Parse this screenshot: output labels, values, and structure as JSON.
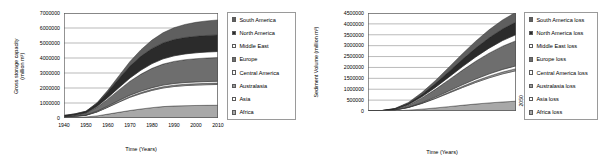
{
  "figure": {
    "background": "#ffffff",
    "panels": [
      "left",
      "right"
    ]
  },
  "left_panel": {
    "ylabel_line1": "Gross storage capacity",
    "ylabel_line2": "(million m³)",
    "xlabel": "Time (Years)",
    "legend_title": ""
  },
  "right_panel": {
    "ylabel": "Sediment Volume (million m³)",
    "xlabel": "Time (Years)",
    "legend_title": ""
  },
  "chart_data": [
    {
      "type": "area",
      "stacked": true,
      "title": "",
      "xlabel": "Time (Years)",
      "ylabel": "Gross storage capacity (million m³)",
      "xlim": [
        1940,
        2010
      ],
      "ylim": [
        0,
        7000000
      ],
      "xticks": [
        1940,
        1950,
        1960,
        1970,
        1980,
        1990,
        2000,
        2010
      ],
      "yticks": [
        0,
        1000000,
        2000000,
        3000000,
        4000000,
        5000000,
        6000000,
        7000000
      ],
      "ytick_labels": [
        "0",
        "1000000",
        "2000000",
        "3000000",
        "4000000",
        "5000000",
        "6000000",
        "7000000"
      ],
      "xtick_labels": [
        "1940",
        "1950",
        "1960",
        "1970",
        "1980",
        "1990",
        "2000",
        "2010"
      ],
      "grid": "horizontal",
      "legend_position": "right",
      "x": [
        1940,
        1945,
        1950,
        1955,
        1960,
        1965,
        1970,
        1975,
        1980,
        1985,
        1990,
        1995,
        2000,
        2005,
        2010
      ],
      "series": [
        {
          "name": "Africa",
          "color": "#a8a8a8",
          "values": [
            30000,
            45000,
            70000,
            140000,
            260000,
            380000,
            500000,
            600000,
            690000,
            760000,
            800000,
            820000,
            835000,
            845000,
            850000
          ]
        },
        {
          "name": "Asia",
          "color": "#ffffff",
          "values": [
            45000,
            70000,
            110000,
            260000,
            460000,
            680000,
            880000,
            1030000,
            1150000,
            1240000,
            1300000,
            1340000,
            1360000,
            1375000,
            1385000
          ]
        },
        {
          "name": "Australasia",
          "color": "#9a9a9a",
          "values": [
            5000,
            8000,
            12000,
            20000,
            32000,
            45000,
            58000,
            68000,
            76000,
            82000,
            86000,
            88000,
            90000,
            91000,
            92000
          ]
        },
        {
          "name": "Central America",
          "color": "#fcfcfc",
          "values": [
            8000,
            12000,
            20000,
            35000,
            52000,
            70000,
            86000,
            98000,
            106000,
            112000,
            116000,
            118000,
            120000,
            121000,
            122000
          ]
        },
        {
          "name": "Europe",
          "color": "#6e6e6e",
          "values": [
            40000,
            70000,
            120000,
            260000,
            470000,
            700000,
            930000,
            1130000,
            1290000,
            1400000,
            1470000,
            1520000,
            1550000,
            1570000,
            1580000
          ]
        },
        {
          "name": "Middle East",
          "color": "#ffffff",
          "values": [
            10000,
            16000,
            26000,
            55000,
            100000,
            155000,
            215000,
            270000,
            315000,
            350000,
            372000,
            386000,
            394000,
            399000,
            402000
          ]
        },
        {
          "name": "North America",
          "color": "#2b2b2b",
          "values": [
            30000,
            50000,
            85000,
            210000,
            400000,
            610000,
            800000,
            930000,
            1010000,
            1060000,
            1085000,
            1095000,
            1100000,
            1103000,
            1105000
          ]
        },
        {
          "name": "South America",
          "color": "#5f5f5f",
          "values": [
            6000,
            9000,
            15000,
            40000,
            90000,
            180000,
            300000,
            430000,
            560000,
            680000,
            790000,
            870000,
            930000,
            970000,
            1000000
          ]
        }
      ],
      "stack_order_bottom_to_top": [
        "Africa",
        "Asia",
        "Australasia",
        "Central America",
        "Europe",
        "Middle East",
        "North America",
        "South America"
      ],
      "total_2010": 6000000
    },
    {
      "type": "area",
      "stacked": true,
      "title": "",
      "xlabel": "Time (Years)",
      "ylabel": "Sediment Volume (million m³)",
      "xlim": [
        1940,
        2050
      ],
      "ylim": [
        0,
        4500000
      ],
      "xticks": [
        1940,
        1950,
        1960,
        1970,
        1980,
        1990,
        2000,
        2010,
        2020,
        2030,
        2040,
        2050
      ],
      "yticks": [
        0,
        500000,
        1000000,
        1500000,
        2000000,
        2500000,
        3000000,
        3500000,
        4000000,
        4500000
      ],
      "ytick_labels": [
        "0",
        "500000",
        "1000000",
        "1500000",
        "2000000",
        "2500000",
        "3000000",
        "3500000",
        "4000000",
        "4500000"
      ],
      "xtick_labels": [
        "1940",
        "1950",
        "1960",
        "1970",
        "1980",
        "1990",
        "2000",
        "2010",
        "2020",
        "2030",
        "2040",
        "2050"
      ],
      "grid": "horizontal",
      "legend_position": "right",
      "x": [
        1940,
        1950,
        1960,
        1970,
        1980,
        1990,
        2000,
        2010,
        2020,
        2030,
        2040,
        2050
      ],
      "series": [
        {
          "name": "Africa loss",
          "color": "#a8a8a8",
          "values": [
            0,
            2000,
            12000,
            40000,
            85000,
            140000,
            200000,
            262000,
            320000,
            372000,
            415000,
            450000
          ]
        },
        {
          "name": "Asia loss",
          "color": "#ffffff",
          "values": [
            0,
            6000,
            36000,
            120000,
            260000,
            430000,
            620000,
            810000,
            990000,
            1150000,
            1290000,
            1400000
          ]
        },
        {
          "name": "Australasia loss",
          "color": "#9a9a9a",
          "values": [
            0,
            400,
            2400,
            8000,
            17000,
            28000,
            40000,
            53000,
            65000,
            76000,
            85000,
            92000
          ]
        },
        {
          "name": "Central America loss",
          "color": "#fcfcfc",
          "values": [
            0,
            600,
            3600,
            12000,
            25000,
            41000,
            58000,
            76000,
            93000,
            108000,
            121000,
            131000
          ]
        },
        {
          "name": "Europe loss",
          "color": "#6e6e6e",
          "values": [
            0,
            5000,
            30000,
            100000,
            215000,
            355000,
            510000,
            665000,
            815000,
            950000,
            1065000,
            1155000
          ]
        },
        {
          "name": "Middle East loss",
          "color": "#ffffff",
          "values": [
            0,
            1200,
            7000,
            24000,
            52000,
            86000,
            124000,
            162000,
            198000,
            231000,
            259000,
            281000
          ]
        },
        {
          "name": "North America loss",
          "color": "#2b2b2b",
          "values": [
            0,
            2500,
            15000,
            50000,
            108000,
            178000,
            255000,
            333000,
            408000,
            475000,
            532000,
            578000
          ]
        },
        {
          "name": "South America loss",
          "color": "#5f5f5f",
          "values": [
            0,
            1800,
            11000,
            38000,
            82000,
            136000,
            196000,
            257000,
            315000,
            368000,
            414000,
            453000
          ]
        }
      ],
      "stack_order_bottom_to_top": [
        "Africa loss",
        "Asia loss",
        "Australasia loss",
        "Central America loss",
        "Europe loss",
        "Middle East loss",
        "North America loss",
        "South America loss"
      ],
      "total_2050": 4540000
    }
  ],
  "left_legend": {
    "items": [
      {
        "label": "South America",
        "swatch": "sw-sa",
        "icon": "legend-swatch-icon"
      },
      {
        "label": "North America",
        "swatch": "sw-na",
        "icon": "legend-swatch-icon"
      },
      {
        "label": "Middle East",
        "swatch": "sw-me",
        "icon": "legend-swatch-icon"
      },
      {
        "label": "Europe",
        "swatch": "sw-eu",
        "icon": "legend-swatch-icon"
      },
      {
        "label": "Central America",
        "swatch": "sw-ca",
        "icon": "legend-swatch-icon"
      },
      {
        "label": "Australasia",
        "swatch": "sw-au",
        "icon": "legend-swatch-icon"
      },
      {
        "label": "Asia",
        "swatch": "sw-as",
        "icon": "legend-swatch-icon"
      },
      {
        "label": "Africa",
        "swatch": "sw-af",
        "icon": "legend-swatch-icon"
      }
    ]
  },
  "right_legend": {
    "items": [
      {
        "label": "South America loss",
        "swatch": "sw-sa",
        "icon": "legend-swatch-icon"
      },
      {
        "label": "North America loss",
        "swatch": "sw-na",
        "icon": "legend-swatch-icon"
      },
      {
        "label": "Middle East loss",
        "swatch": "sw-me",
        "icon": "legend-swatch-icon"
      },
      {
        "label": "Europe loss",
        "swatch": "sw-eu",
        "icon": "legend-swatch-icon"
      },
      {
        "label": "Central America loss",
        "swatch": "sw-ca",
        "icon": "legend-swatch-icon"
      },
      {
        "label": "Australasia loss",
        "swatch": "sw-au",
        "icon": "legend-swatch-icon"
      },
      {
        "label": "Asia loss",
        "swatch": "sw-as",
        "icon": "legend-swatch-icon"
      },
      {
        "label": "Africa loss",
        "swatch": "sw-af",
        "icon": "legend-swatch-icon"
      }
    ]
  }
}
